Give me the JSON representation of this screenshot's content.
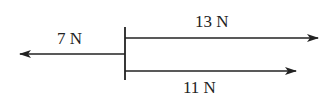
{
  "diagram": {
    "type": "free-body force diagram",
    "forces": [
      {
        "label": "7 N",
        "direction": "left",
        "magnitude": 7
      },
      {
        "label": "13 N",
        "direction": "right",
        "magnitude": 13
      },
      {
        "label": "11 N",
        "direction": "right",
        "magnitude": 11
      }
    ],
    "colors": {
      "stroke": "#222222",
      "background": "#ffffff"
    }
  }
}
